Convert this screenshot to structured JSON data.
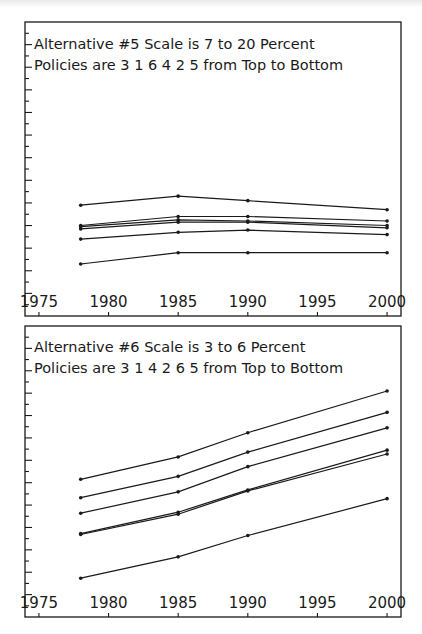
{
  "chart_data": [
    {
      "type": "line",
      "title": "Alternative #5  Scale is 7 to 20 Percent",
      "subtitle": "Policies are 3 1 6 4 2 5 from Top to Bottom",
      "xlabel": "",
      "ylabel": "",
      "x_tick_labels": [
        "1975",
        "1980",
        "1985",
        "1990",
        "1995",
        "2000"
      ],
      "xlim": [
        1974,
        2001
      ],
      "ylim": [
        7,
        20
      ],
      "x": [
        1978,
        1985,
        1990,
        2000
      ],
      "grid": false,
      "series": [
        {
          "name": "Policy 3",
          "values": [
            11.9,
            12.3,
            12.1,
            11.7
          ]
        },
        {
          "name": "Policy 1",
          "values": [
            11.0,
            11.4,
            11.4,
            11.2
          ]
        },
        {
          "name": "Policy 6",
          "values": [
            10.95,
            11.25,
            11.2,
            11.0
          ]
        },
        {
          "name": "Policy 4",
          "values": [
            10.85,
            11.15,
            11.15,
            10.9
          ]
        },
        {
          "name": "Policy 2",
          "values": [
            10.4,
            10.7,
            10.8,
            10.6
          ]
        },
        {
          "name": "Policy 5",
          "values": [
            9.3,
            9.8,
            9.8,
            9.8
          ]
        }
      ]
    },
    {
      "type": "line",
      "title": "Alternative #6  Scale is 3 to 6 Percent",
      "subtitle": "Policies are 3 1 4 2 6 5 from Top to Bottom",
      "xlabel": "",
      "ylabel": "",
      "x_tick_labels": [
        "1975",
        "1980",
        "1985",
        "1990",
        "1995",
        "2000"
      ],
      "xlim": [
        1974,
        2001
      ],
      "ylim": [
        3,
        6
      ],
      "x": [
        1978,
        1985,
        1990,
        2000
      ],
      "grid": false,
      "series": [
        {
          "name": "Policy 3",
          "values": [
            4.42,
            4.65,
            4.9,
            5.33
          ]
        },
        {
          "name": "Policy 1",
          "values": [
            4.23,
            4.45,
            4.7,
            5.11
          ]
        },
        {
          "name": "Policy 4",
          "values": [
            4.07,
            4.29,
            4.55,
            4.95
          ]
        },
        {
          "name": "Policy 2",
          "values": [
            3.86,
            4.08,
            4.31,
            4.72
          ]
        },
        {
          "name": "Policy 6",
          "values": [
            3.85,
            4.06,
            4.3,
            4.68
          ]
        },
        {
          "name": "Policy 5",
          "values": [
            3.4,
            3.62,
            3.84,
            4.22
          ]
        }
      ]
    }
  ],
  "panels": [
    {
      "title_line1": "Alternative #5   Scale is 7 to 20 Percent",
      "title_line2": "Policies are  3 1 6 4 2 5  from Top to Bottom"
    },
    {
      "title_line1": "Alternative #6   Scale is 3 to 6 Percent",
      "title_line2": "Policies are  3 1 4 2 6 5  from Top to Bottom"
    }
  ],
  "style": {
    "ink": "#1a1a1a",
    "paper": "#ffffff"
  }
}
